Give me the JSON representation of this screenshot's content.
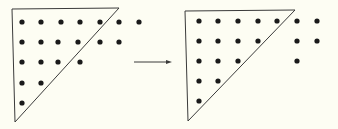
{
  "diagram": {
    "colors": {
      "background": "#fdfdf3",
      "ink": "#1a1a1a",
      "line": "#3a3a3a"
    },
    "dot_radius": 2.6,
    "panels": [
      {
        "id": "before",
        "triangle": [
          [
            12,
            9
          ],
          [
            119,
            8
          ],
          [
            15,
            122
          ]
        ],
        "dots": [
          [
            22,
            22
          ],
          [
            41,
            22
          ],
          [
            61,
            22
          ],
          [
            80,
            22
          ],
          [
            100,
            22
          ],
          [
            119,
            22
          ],
          [
            139,
            22
          ],
          [
            22,
            42
          ],
          [
            41,
            42
          ],
          [
            58,
            42
          ],
          [
            78,
            42
          ],
          [
            100,
            42
          ],
          [
            119,
            42
          ],
          [
            22,
            62
          ],
          [
            41,
            62
          ],
          [
            58,
            62
          ],
          [
            80,
            62
          ],
          [
            22,
            83
          ],
          [
            41,
            83
          ],
          [
            22,
            103
          ]
        ]
      },
      {
        "id": "after",
        "triangle": [
          [
            185,
            11
          ],
          [
            295,
            10
          ],
          [
            188,
            121
          ]
        ],
        "dots": [
          [
            199,
            21
          ],
          [
            218,
            21
          ],
          [
            238,
            21
          ],
          [
            258,
            21
          ],
          [
            277,
            21
          ],
          [
            297,
            21
          ],
          [
            317,
            21
          ],
          [
            199,
            41
          ],
          [
            218,
            41
          ],
          [
            238,
            41
          ],
          [
            258,
            41
          ],
          [
            297,
            41
          ],
          [
            317,
            41
          ],
          [
            199,
            61
          ],
          [
            218,
            61
          ],
          [
            238,
            61
          ],
          [
            297,
            61
          ],
          [
            199,
            81
          ],
          [
            218,
            81
          ],
          [
            199,
            101
          ]
        ]
      }
    ],
    "arrow": {
      "from": [
        134,
        62
      ],
      "to": [
        172,
        62
      ]
    }
  }
}
